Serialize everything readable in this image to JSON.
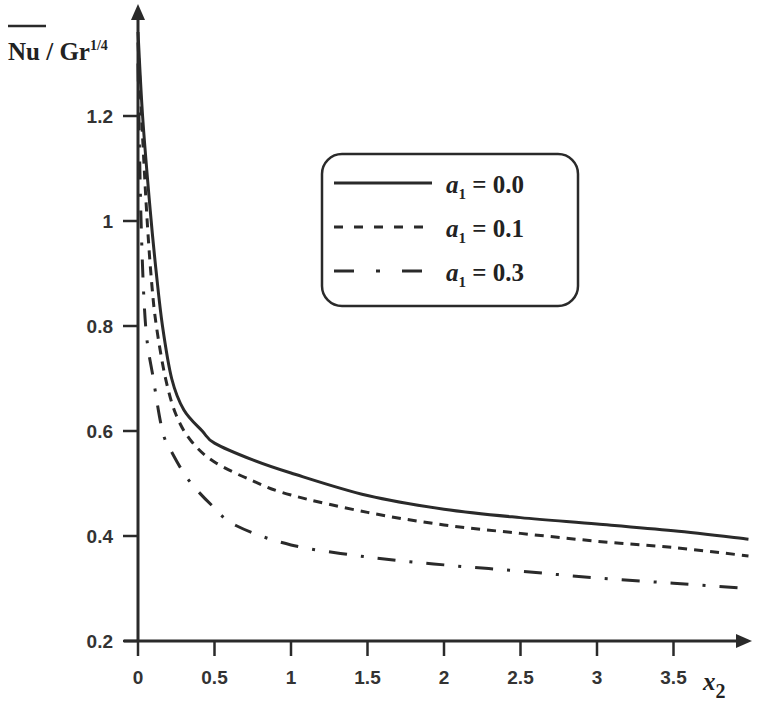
{
  "chart_data": {
    "type": "line",
    "title": "",
    "xlabel": "x2",
    "ylabel": "Nu / Gr^1/4",
    "ylabel_parts": {
      "main": "Nu / Gr",
      "sup": "1/4"
    },
    "xlabel_parts": {
      "main": "x",
      "sub": "2"
    },
    "xlim": [
      0,
      4.0
    ],
    "ylim": [
      0.2,
      1.38
    ],
    "xticks": [
      "0",
      "0.5",
      "1",
      "1.5",
      "2",
      "2.5",
      "3",
      "3.5"
    ],
    "yticks": [
      "0.2",
      "0.4",
      "0.6",
      "0.8",
      "1",
      "1.2"
    ],
    "grid": false,
    "legend_position": "upper-right (inside)",
    "series": [
      {
        "name": "a1 = 0.0",
        "label_parts": {
          "var": "a",
          "sub": "1",
          "rest": " = 0.0"
        },
        "style": "solid",
        "x": [
          0.0,
          0.03,
          0.08,
          0.12,
          0.16,
          0.22,
          0.3,
          0.42,
          0.5,
          0.75,
          1.0,
          1.5,
          2.0,
          2.5,
          3.0,
          3.5,
          3.99
        ],
        "y": [
          1.36,
          1.2,
          1.02,
          0.9,
          0.8,
          0.7,
          0.64,
          0.6,
          0.577,
          0.545,
          0.52,
          0.477,
          0.451,
          0.435,
          0.423,
          0.41,
          0.394
        ]
      },
      {
        "name": "a1 = 0.1",
        "label_parts": {
          "var": "a",
          "sub": "1",
          "rest": " = 0.1"
        },
        "style": "dashed",
        "x": [
          0.0,
          0.03,
          0.06,
          0.09,
          0.12,
          0.18,
          0.25,
          0.35,
          0.5,
          0.75,
          1.0,
          1.5,
          2.0,
          2.5,
          3.0,
          3.5,
          3.99
        ],
        "y": [
          1.34,
          1.16,
          1.0,
          0.88,
          0.8,
          0.7,
          0.63,
          0.58,
          0.541,
          0.505,
          0.478,
          0.445,
          0.421,
          0.405,
          0.39,
          0.378,
          0.362
        ]
      },
      {
        "name": "a1 = 0.3",
        "label_parts": {
          "var": "a",
          "sub": "1",
          "rest": " = 0.3"
        },
        "style": "dash-dot",
        "x": [
          0.0,
          0.02,
          0.05,
          0.1,
          0.16,
          0.22,
          0.33,
          0.48,
          0.64,
          1.0,
          1.5,
          2.0,
          2.5,
          3.0,
          3.5,
          3.99
        ],
        "y": [
          1.3,
          1.0,
          0.8,
          0.7,
          0.6,
          0.56,
          0.507,
          0.459,
          0.42,
          0.383,
          0.36,
          0.345,
          0.333,
          0.32,
          0.31,
          0.3
        ]
      }
    ]
  }
}
